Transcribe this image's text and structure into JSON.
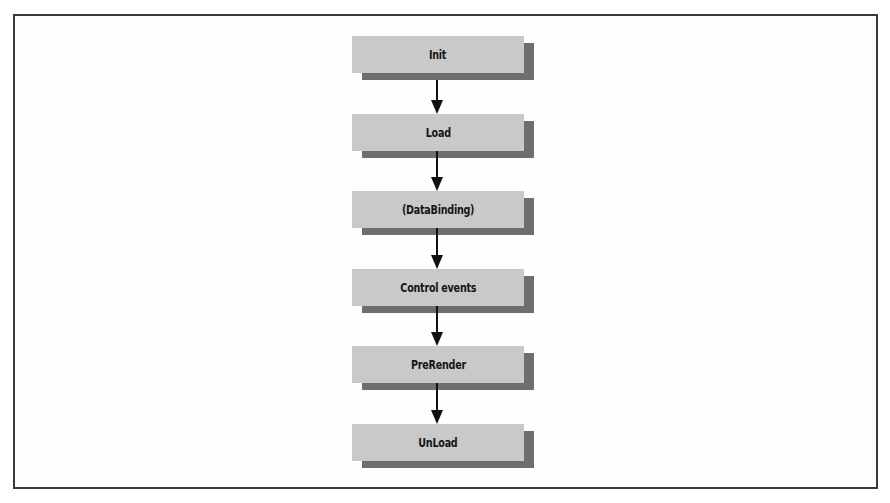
{
  "diagram": {
    "type": "flowchart",
    "direction": "top-to-bottom",
    "nodes": [
      {
        "id": "init",
        "label": "Init"
      },
      {
        "id": "load",
        "label": "Load"
      },
      {
        "id": "databinding",
        "label": "(DataBinding)"
      },
      {
        "id": "control-events",
        "label": "Control events"
      },
      {
        "id": "prerender",
        "label": "PreRender"
      },
      {
        "id": "unload",
        "label": "UnLoad"
      }
    ],
    "edges": [
      {
        "from": "init",
        "to": "load"
      },
      {
        "from": "load",
        "to": "databinding"
      },
      {
        "from": "databinding",
        "to": "control-events"
      },
      {
        "from": "control-events",
        "to": "prerender"
      },
      {
        "from": "prerender",
        "to": "unload"
      }
    ],
    "colors": {
      "node_fill": "#c9c9c9",
      "node_shadow": "#6e6e6e",
      "arrow": "#111111",
      "frame": "#3a3a3a",
      "text": "#151515"
    }
  }
}
